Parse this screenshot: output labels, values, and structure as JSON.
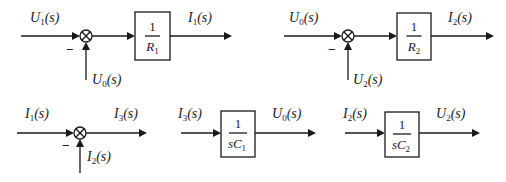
{
  "diagram": {
    "type": "block-diagram",
    "blocks": [
      {
        "id": "top-left",
        "input": {
          "sym": "U",
          "sub": "1",
          "arg": "(s)"
        },
        "feedback": {
          "sym": "U",
          "sub": "0",
          "arg": "(s)",
          "sign": "−"
        },
        "gain": {
          "num": "1",
          "den_sym": "R",
          "den_sub": "1"
        },
        "output": {
          "sym": "I",
          "sub": "1",
          "arg": "(s)"
        }
      },
      {
        "id": "top-right",
        "input": {
          "sym": "U",
          "sub": "0",
          "arg": "(s)"
        },
        "feedback": {
          "sym": "U",
          "sub": "2",
          "arg": "(s)",
          "sign": "−"
        },
        "gain": {
          "num": "1",
          "den_sym": "R",
          "den_sub": "2"
        },
        "output": {
          "sym": "I",
          "sub": "2",
          "arg": "(s)"
        }
      },
      {
        "id": "bottom-left",
        "input": {
          "sym": "I",
          "sub": "1",
          "arg": "(s)"
        },
        "feedback": {
          "sym": "I",
          "sub": "2",
          "arg": "(s)",
          "sign": "−"
        },
        "output": {
          "sym": "I",
          "sub": "3",
          "arg": "(s)"
        }
      },
      {
        "id": "bottom-middle",
        "input": {
          "sym": "I",
          "sub": "3",
          "arg": "(s)"
        },
        "gain": {
          "num": "1",
          "den_pre": "s",
          "den_sym": "C",
          "den_sub": "1"
        },
        "output": {
          "sym": "U",
          "sub": "0",
          "arg": "(s)"
        }
      },
      {
        "id": "bottom-right",
        "input": {
          "sym": "I",
          "sub": "2",
          "arg": "(s)"
        },
        "gain": {
          "num": "1",
          "den_pre": "s",
          "den_sym": "C",
          "den_sub": "2"
        },
        "output": {
          "sym": "U",
          "sub": "2",
          "arg": "(s)"
        }
      }
    ]
  }
}
